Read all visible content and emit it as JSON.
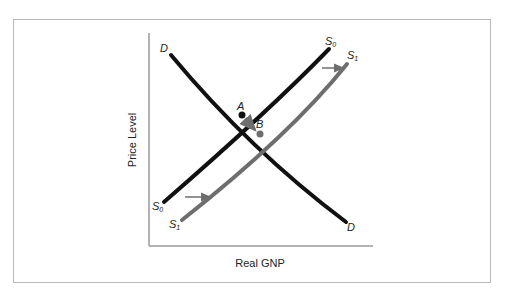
{
  "diagram": {
    "axes": {
      "x_label": "Real GNP",
      "y_label": "Price Level"
    },
    "curves": [
      {
        "id": "D",
        "label_start": "D",
        "label_end": "D",
        "color": "#111111",
        "type": "demand"
      },
      {
        "id": "S0",
        "label": "S",
        "subscript": "0",
        "color": "#111111",
        "type": "supply"
      },
      {
        "id": "S1",
        "label": "S",
        "subscript": "1",
        "color": "#6e6e6e",
        "type": "supply"
      }
    ],
    "points": [
      {
        "label": "A",
        "desc": "initial equilibrium (D, S0)"
      },
      {
        "label": "B",
        "desc": "new equilibrium (D, S1)"
      }
    ],
    "arrows": [
      {
        "desc": "supply shift right (bottom)"
      },
      {
        "desc": "supply shift right (top)"
      },
      {
        "desc": "movement along D from A to B"
      }
    ],
    "colors": {
      "frame": "#b8b8b8",
      "axis": "#9a9a9a",
      "primary_curve": "#111111",
      "shifted_curve": "#6e6e6e"
    }
  }
}
